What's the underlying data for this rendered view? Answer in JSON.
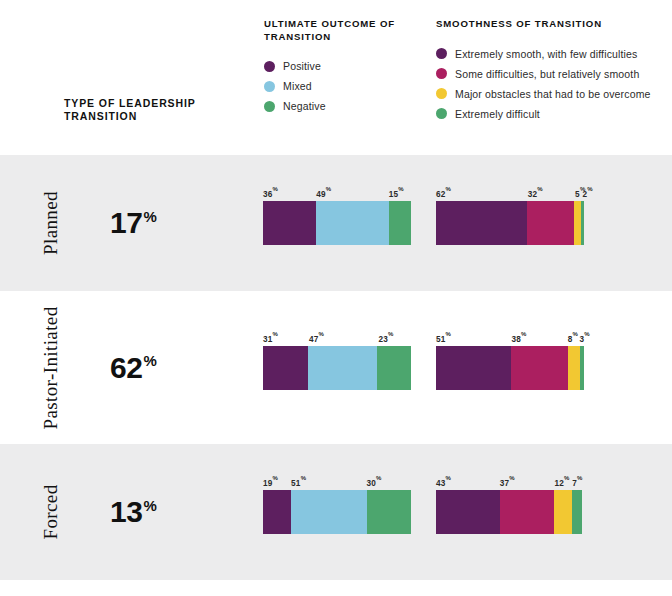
{
  "header": {
    "row_label_title": "TYPE OF LEADERSHIP TRANSITION",
    "legends": [
      {
        "title": "ULTIMATE OUTCOME OF TRANSITION",
        "items": [
          {
            "label": "Positive",
            "color": "#5d1f5f"
          },
          {
            "label": "Mixed",
            "color": "#86c6e0"
          },
          {
            "label": "Negative",
            "color": "#4ca66e"
          }
        ]
      },
      {
        "title": "SMOOTHNESS OF TRANSITION",
        "items": [
          {
            "label": "Extremely smooth, with few difficulties",
            "color": "#5d1f5f"
          },
          {
            "label": "Some difficulties, but relatively smooth",
            "color": "#ab1f60"
          },
          {
            "label": "Major obstacles that had to be overcome",
            "color": "#f2c832"
          },
          {
            "label": "Extremely difficult",
            "color": "#4ca66e"
          }
        ]
      }
    ]
  },
  "chart_data": {
    "type": "bar",
    "title": "TYPE OF LEADERSHIP TRANSITION",
    "subtype": "100% stacked horizontal bars, two series groups per category",
    "categories": [
      "Planned",
      "Pastor-Initiated",
      "Forced"
    ],
    "category_share_label": [
      "17%",
      "62%",
      "13%"
    ],
    "category_share_values": [
      17,
      62,
      13
    ],
    "groups": [
      {
        "name": "ULTIMATE OUTCOME OF TRANSITION",
        "segment_names": [
          "Positive",
          "Mixed",
          "Negative"
        ],
        "segment_colors": [
          "#5d1f5f",
          "#86c6e0",
          "#4ca66e"
        ],
        "rows": [
          {
            "category": "Planned",
            "values": [
              36,
              49,
              15
            ],
            "labels": [
              "36",
              "49",
              "15"
            ]
          },
          {
            "category": "Pastor-Initiated",
            "values": [
              31,
              47,
              23
            ],
            "labels": [
              "31",
              "47",
              "23"
            ]
          },
          {
            "category": "Forced",
            "values": [
              19,
              51,
              30
            ],
            "labels": [
              "19",
              "51",
              "30"
            ]
          }
        ]
      },
      {
        "name": "SMOOTHNESS OF TRANSITION",
        "segment_names": [
          "Extremely smooth, with few difficulties",
          "Some difficulties, but relatively smooth",
          "Major obstacles that had to be overcome",
          "Extremely difficult"
        ],
        "segment_colors": [
          "#5d1f5f",
          "#ab1f60",
          "#f2c832",
          "#4ca66e"
        ],
        "rows": [
          {
            "category": "Planned",
            "values": [
              62,
              32,
              5,
              2
            ],
            "labels": [
              "62",
              "32",
              "5",
              "2"
            ]
          },
          {
            "category": "Pastor-Initiated",
            "values": [
              51,
              38,
              8,
              3
            ],
            "labels": [
              "51",
              "38",
              "8",
              "3"
            ]
          },
          {
            "category": "Forced",
            "values": [
              43,
              37,
              12,
              7
            ],
            "labels": [
              "43",
              "37",
              "12",
              "7"
            ]
          }
        ]
      }
    ],
    "percent_symbol": "%",
    "grid": false,
    "legend_position": "top"
  },
  "style": {
    "band_shaded": "#ececed",
    "band_plain": "#ffffff"
  }
}
